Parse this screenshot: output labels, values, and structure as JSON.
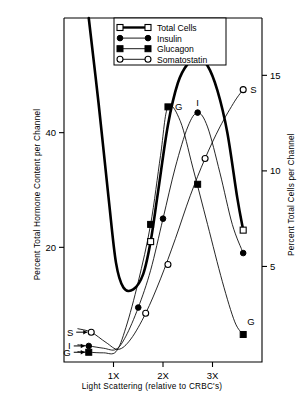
{
  "chart_data": {
    "type": "line",
    "title": "",
    "xlabel": "Light Scattering (relative to CRBC's)",
    "ylabel": "Percent Total Hormone Content per Channel",
    "y2label": "Percent Total Cells per Channel",
    "xlim": [
      0.0,
      4.0
    ],
    "ylim": [
      0,
      60
    ],
    "y2lim": [
      0,
      18
    ],
    "xticks": [
      1,
      2,
      3
    ],
    "xticklabels": [
      "1X",
      "2X",
      "3X"
    ],
    "yticks": [
      20,
      40
    ],
    "yticklabels": [
      "20",
      "40"
    ],
    "y2ticks": [
      5,
      10,
      15
    ],
    "y2ticklabels": [
      "5",
      "10",
      "15"
    ],
    "grid": false,
    "legend_position": "top-center",
    "series": [
      {
        "name": "Total Cells",
        "axis": "right",
        "marker": "open-square",
        "linewidth": "thick",
        "label_on_plot": "",
        "x": [
          0.5,
          0.7,
          0.9,
          1.05,
          1.2,
          1.4,
          1.6,
          1.75,
          1.9,
          2.1,
          2.3,
          2.5,
          2.7,
          2.9,
          3.1,
          3.3,
          3.5,
          3.62
        ],
        "y": [
          18.0,
          13.5,
          8.6,
          5.2,
          3.9,
          3.8,
          4.6,
          6.3,
          8.9,
          12.4,
          14.6,
          15.6,
          15.9,
          15.5,
          14.2,
          12.0,
          8.6,
          6.9
        ],
        "markers": [
          {
            "x": 1.75,
            "y": 6.3
          },
          {
            "x": 2.7,
            "y": 15.9
          },
          {
            "x": 3.62,
            "y": 6.9
          }
        ]
      },
      {
        "name": "Insulin",
        "axis": "left",
        "marker": "filled-circle",
        "linewidth": "thin",
        "label_on_plot": "I",
        "x": [
          0.28,
          0.5,
          0.8,
          1.05,
          1.25,
          1.5,
          1.75,
          2.0,
          2.25,
          2.5,
          2.7,
          2.9,
          3.15,
          3.4,
          3.62
        ],
        "y": [
          3.0,
          2.8,
          2.4,
          2.2,
          4.5,
          9.5,
          16.0,
          25.0,
          34.0,
          41.0,
          43.5,
          41.0,
          33.0,
          24.0,
          19.0
        ],
        "markers": [
          {
            "x": 0.5,
            "y": 2.8
          },
          {
            "x": 1.5,
            "y": 9.5
          },
          {
            "x": 2.0,
            "y": 25.0
          },
          {
            "x": 2.7,
            "y": 43.5
          },
          {
            "x": 3.62,
            "y": 19.0
          }
        ]
      },
      {
        "name": "Glucagon",
        "axis": "left",
        "marker": "filled-square",
        "linewidth": "thin",
        "label_on_plot": "G",
        "x": [
          0.28,
          0.5,
          0.8,
          1.05,
          1.25,
          1.5,
          1.75,
          1.95,
          2.1,
          2.35,
          2.6,
          2.9,
          3.2,
          3.45,
          3.62
        ],
        "y": [
          1.8,
          1.7,
          1.6,
          1.8,
          6.0,
          14.0,
          24.0,
          36.0,
          44.5,
          42.0,
          34.0,
          24.0,
          14.0,
          7.0,
          4.8
        ],
        "markers": [
          {
            "x": 0.5,
            "y": 1.7
          },
          {
            "x": 1.75,
            "y": 24.0
          },
          {
            "x": 2.1,
            "y": 44.5
          },
          {
            "x": 2.7,
            "y": 31.0
          },
          {
            "x": 3.62,
            "y": 4.8
          }
        ]
      },
      {
        "name": "Somatostatin",
        "axis": "left",
        "marker": "open-circle",
        "linewidth": "thin",
        "label_on_plot": "S",
        "x": [
          0.28,
          0.55,
          0.85,
          1.1,
          1.35,
          1.65,
          1.95,
          2.25,
          2.55,
          2.85,
          3.15,
          3.45,
          3.62
        ],
        "y": [
          5.8,
          5.2,
          3.4,
          2.2,
          4.0,
          8.5,
          14.5,
          21.5,
          29.0,
          35.5,
          41.0,
          45.5,
          47.5
        ],
        "markers": [
          {
            "x": 0.55,
            "y": 5.2
          },
          {
            "x": 1.65,
            "y": 8.5
          },
          {
            "x": 2.1,
            "y": 17.0
          },
          {
            "x": 2.85,
            "y": 35.5
          },
          {
            "x": 3.62,
            "y": 47.5
          }
        ]
      }
    ],
    "annotations": [
      {
        "text": "G",
        "x": 2.1,
        "y": 44.5,
        "axis": "left",
        "position": "right"
      },
      {
        "text": "I",
        "x": 2.7,
        "y": 43.5,
        "axis": "left",
        "position": "above"
      },
      {
        "text": "S",
        "x": 3.62,
        "y": 47.5,
        "axis": "left",
        "position": "right"
      },
      {
        "text": "G",
        "x": 3.62,
        "y": 4.8,
        "axis": "left",
        "position": "upper-right"
      },
      {
        "text": "S",
        "x": 0.55,
        "y": 5.2,
        "axis": "left",
        "position": "left-arrow"
      },
      {
        "text": "I",
        "x": 0.5,
        "y": 2.8,
        "axis": "left",
        "position": "left-arrow"
      },
      {
        "text": "G",
        "x": 0.5,
        "y": 1.7,
        "axis": "left",
        "position": "left-arrow"
      }
    ]
  },
  "legend": {
    "items": [
      {
        "label": "Total Cells",
        "marker": "open-square",
        "line": "thick"
      },
      {
        "label": "Insulin",
        "marker": "filled-circle",
        "line": "thin"
      },
      {
        "label": "Glucagon",
        "marker": "filled-square",
        "line": "thin"
      },
      {
        "label": "Somatostatin",
        "marker": "open-circle",
        "line": "thin"
      }
    ]
  },
  "axes": {
    "left_title": "Percent Total Hormone Content per Channel",
    "right_title": "Percent Total Cells per Channel",
    "x_title": "Light Scattering (relative to CRBC's)",
    "left_ticks": [
      "40",
      "20"
    ],
    "right_ticks": [
      "15",
      "10",
      "5"
    ],
    "x_ticks": [
      "1X",
      "2X",
      "3X"
    ]
  },
  "colors": {
    "ink": "#000000",
    "background": "#ffffff"
  }
}
